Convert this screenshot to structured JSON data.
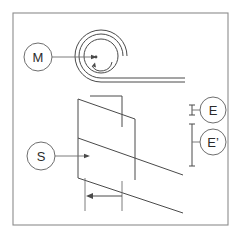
{
  "figure": {
    "type": "technical-line-diagram",
    "background_color": "#ffffff",
    "line_color": "#4a4a4a",
    "frame_color": "#8c8c8c",
    "width_px": 242,
    "height_px": 239
  },
  "callouts": [
    {
      "id": "M",
      "label": "M",
      "meaning": "coil-roll",
      "center": {
        "x": 38,
        "y": 57
      },
      "radius": 14,
      "leader_from": {
        "x": 52,
        "y": 57
      },
      "leader_to": {
        "x": 95,
        "y": 57
      }
    },
    {
      "id": "S",
      "label": "S",
      "meaning": "sheet-strip",
      "center": {
        "x": 41,
        "y": 156
      },
      "radius": 14,
      "leader_from": {
        "x": 55,
        "y": 156
      },
      "leader_to": {
        "x": 88,
        "y": 156
      }
    },
    {
      "id": "E",
      "label": "E",
      "meaning": "thickness-before",
      "center": {
        "x": 213,
        "y": 110
      },
      "radius": 13,
      "leader_from": {
        "x": 200,
        "y": 110
      },
      "leader_to": {
        "x": 192,
        "y": 110
      }
    },
    {
      "id": "Eprime",
      "label": "E’",
      "meaning": "thickness-after",
      "center": {
        "x": 213,
        "y": 142
      },
      "radius": 13,
      "leader_from": {
        "x": 200,
        "y": 142
      },
      "leader_to": {
        "x": 192,
        "y": 142
      }
    }
  ],
  "dimensions": [
    {
      "name": "E",
      "kind": "small-thickness-tick",
      "x": 192,
      "y_top": 105,
      "y_bottom": 115
    },
    {
      "name": "E-prime",
      "kind": "tall-thickness-bar",
      "x": 192,
      "y_top": 124,
      "y_bottom": 166
    },
    {
      "name": "feed-width",
      "kind": "horizontal-arrow",
      "x_left": 85,
      "x_right": 122,
      "y": 196,
      "direction": "left",
      "ext_left": {
        "x": 85,
        "y_top": 178,
        "y_bottom": 211
      },
      "ext_right": {
        "x": 122,
        "y_top": 180,
        "y_bottom": 211
      }
    }
  ],
  "coil": {
    "name": "roll",
    "center": {
      "x": 101,
      "y": 56
    },
    "outer_radius": 26,
    "mid_radius": 22,
    "inner_radius": 17,
    "hub_dot": {
      "x": 96,
      "y": 57,
      "r": 1.3
    },
    "rotation_arrow": "counter-clockwise",
    "strip_top_y": 76,
    "strip_bottom_y": 82,
    "strip_end_x": 185
  },
  "sheet": {
    "name": "strip-forming-sheet",
    "top_tab": [
      {
        "x": 90,
        "y": 96
      },
      {
        "x": 122,
        "y": 96
      },
      {
        "x": 122,
        "y": 127
      }
    ],
    "left_edge": [
      {
        "x": 78,
        "y": 99
      },
      {
        "x": 78,
        "y": 178
      }
    ],
    "upper_diagonal": [
      {
        "x": 78,
        "y": 99
      },
      {
        "x": 135,
        "y": 119
      }
    ],
    "right_edge": [
      {
        "x": 135,
        "y": 119
      },
      {
        "x": 135,
        "y": 180
      }
    ],
    "mid_diagonal": [
      {
        "x": 78,
        "y": 138
      },
      {
        "x": 183,
        "y": 175
      }
    ],
    "lower_diagonal": [
      {
        "x": 78,
        "y": 178
      },
      {
        "x": 183,
        "y": 213
      }
    ]
  }
}
